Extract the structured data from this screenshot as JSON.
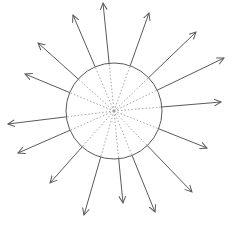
{
  "diagram": {
    "type": "radial-arrows",
    "background": "#ffffff",
    "line_color": "#5a5a5a",
    "dot_color": "#9a9a9a",
    "circle": {
      "cx": 114,
      "cy": 111,
      "r": 48
    },
    "arrow_tips": [
      [
        103,
        3
      ],
      [
        149,
        13
      ],
      [
        196,
        32
      ],
      [
        224,
        58
      ],
      [
        221,
        102
      ],
      [
        207,
        148
      ],
      [
        192,
        192
      ],
      [
        155,
        212
      ],
      [
        123,
        203
      ],
      [
        84,
        215
      ],
      [
        50,
        183
      ],
      [
        18,
        153
      ],
      [
        8,
        124
      ],
      [
        25,
        74
      ],
      [
        38,
        43
      ],
      [
        73,
        15
      ]
    ]
  }
}
